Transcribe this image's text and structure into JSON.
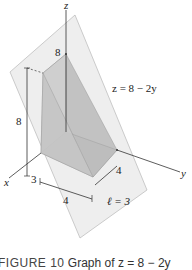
{
  "figure": {
    "axes": {
      "x": "x",
      "y": "y",
      "z": "z"
    },
    "plane_label": "z = 8 − 2y",
    "labels": {
      "z_top": "8",
      "height": "8",
      "x_mark": "3",
      "y_mark": "4",
      "base_width": "4",
      "slice_length": "ℓ = 3"
    },
    "caption": {
      "prefix": "FIGURE 10",
      "text": "Graph of z = 8 − 2y"
    },
    "colors": {
      "plane_fill": "#eeeeee",
      "solid_front": "#c9c9c9",
      "solid_side": "#b5b5b5",
      "line": "#333333"
    }
  }
}
